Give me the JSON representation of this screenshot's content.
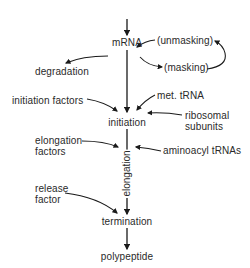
{
  "diagram": {
    "type": "flowchart",
    "nodes": {
      "mrna": "mRNA",
      "degradation": "degradation",
      "unmasking": "(unmasking)",
      "masking": "(masking)",
      "initiation_factors": "initiation factors",
      "met_trna": "met. tRNA",
      "initiation": "initiation",
      "ribosomal_line1": "ribosomal",
      "ribosomal_line2": "subunits",
      "elongation_factors_line1": "elongation",
      "elongation_factors_line2": "factors",
      "elongation": "elongation",
      "aminoacyl_trnas": "aminoacyl tRNAs",
      "release_factor_line1": "release",
      "release_factor_line2": "factor",
      "termination": "termination",
      "polypeptide": "polypeptide"
    },
    "edges": [
      {
        "from": "top",
        "to": "mRNA"
      },
      {
        "from": "mRNA",
        "to": "degradation"
      },
      {
        "from": "mRNA",
        "to": "(masking)"
      },
      {
        "from": "(masking)",
        "to": "(unmasking)"
      },
      {
        "from": "(unmasking)",
        "to": "mRNA"
      },
      {
        "from": "mRNA",
        "to": "initiation"
      },
      {
        "from": "initiation factors",
        "to": "initiation"
      },
      {
        "from": "met. tRNA",
        "to": "initiation"
      },
      {
        "from": "ribosomal subunits",
        "to": "initiation"
      },
      {
        "from": "initiation",
        "to": "termination",
        "label": "elongation"
      },
      {
        "from": "elongation factors",
        "to": "elongation"
      },
      {
        "from": "aminoacyl tRNAs",
        "to": "elongation"
      },
      {
        "from": "release factor",
        "to": "termination"
      },
      {
        "from": "termination",
        "to": "polypeptide"
      }
    ],
    "colors": {
      "line": "#1a1a1a",
      "text": "#2a2a2a",
      "background": "#ffffff"
    }
  }
}
